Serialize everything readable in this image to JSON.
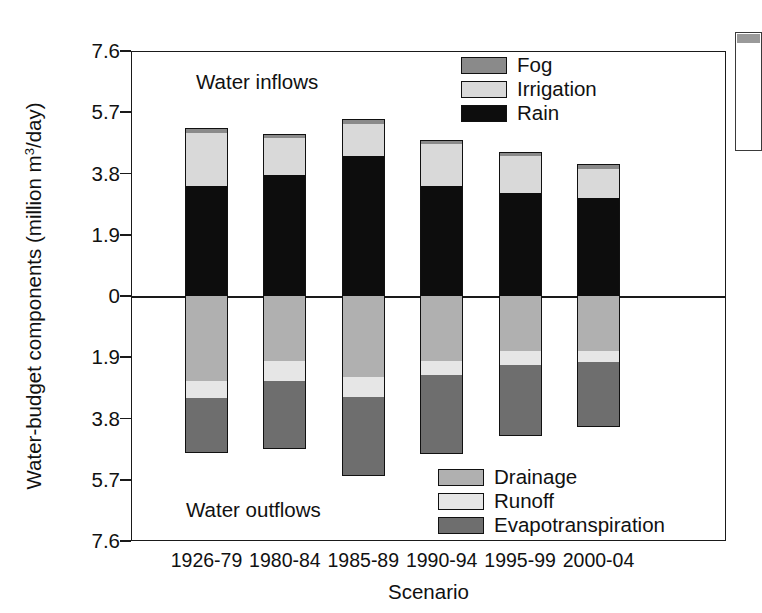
{
  "chart_data": {
    "type": "bar",
    "subtype": "stacked-diverging",
    "title": "",
    "xlabel": "Scenario",
    "ylabel": "Water-budget components (million m3/day)",
    "ylabel_prefix": "Water-budget components (million m",
    "ylabel_sup": "3",
    "ylabel_suffix": "/day)",
    "categories": [
      "1926-79",
      "1980-84",
      "1985-89",
      "1990-94",
      "1995-99",
      "2000-04"
    ],
    "ylim": [
      -7.6,
      7.6
    ],
    "ytick_labels": [
      "7.6",
      "5.7",
      "3.8",
      "1.9",
      "0",
      "1.9",
      "3.8",
      "5.7",
      "7.6"
    ],
    "ytick_values": [
      7.6,
      5.7,
      3.8,
      1.9,
      0,
      -1.9,
      -3.8,
      -5.7,
      -7.6
    ],
    "grid": false,
    "annotations": [
      {
        "text": "Water inflows",
        "position": "upper-left-plot"
      },
      {
        "text": "Water outflows",
        "position": "lower-left-plot"
      }
    ],
    "series": [
      {
        "name": "Rain",
        "group": "inflows",
        "color": "#0d0d0d",
        "values": [
          3.4,
          3.75,
          4.35,
          3.4,
          3.2,
          3.05
        ]
      },
      {
        "name": "Irrigation",
        "group": "inflows",
        "color": "#d9d9d9",
        "values": [
          1.65,
          1.15,
          0.99,
          1.3,
          1.15,
          0.9
        ]
      },
      {
        "name": "Fog",
        "group": "inflows",
        "color": "#8a8a8a",
        "values": [
          0.16,
          0.13,
          0.15,
          0.14,
          0.13,
          0.13
        ]
      },
      {
        "name": "Drainage",
        "group": "outflows",
        "color": "#b0b0b0",
        "values": [
          2.65,
          2.03,
          2.5,
          2.03,
          1.7,
          1.7
        ]
      },
      {
        "name": "Runoff",
        "group": "outflows",
        "color": "#e6e6e6",
        "values": [
          0.52,
          0.62,
          0.62,
          0.43,
          0.43,
          0.35
        ]
      },
      {
        "name": "Evapotranspiration",
        "group": "outflows",
        "color": "#6e6e6e",
        "values": [
          1.7,
          2.1,
          2.45,
          2.43,
          2.22,
          2.02
        ]
      }
    ],
    "totals_inflow": [
      5.21,
      5.03,
      5.49,
      4.84,
      4.48,
      4.08
    ],
    "totals_outflow": [
      4.87,
      4.75,
      5.57,
      4.89,
      4.35,
      4.07
    ]
  },
  "legend_inflows": {
    "position": "upper-right-inside-plot",
    "items": [
      {
        "label": "Fog",
        "color": "#8a8a8a"
      },
      {
        "label": "Irrigation",
        "color": "#d9d9d9"
      },
      {
        "label": "Rain",
        "color": "#0d0d0d"
      }
    ]
  },
  "legend_outflows": {
    "position": "lower-right-inside-plot",
    "items": [
      {
        "label": "Drainage",
        "color": "#b0b0b0"
      },
      {
        "label": "Runoff",
        "color": "#e6e6e6"
      },
      {
        "label": "Evapotranspiration",
        "color": "#6e6e6e"
      }
    ]
  },
  "annotations": {
    "inflows": "Water inflows",
    "outflows": "Water outflows"
  }
}
